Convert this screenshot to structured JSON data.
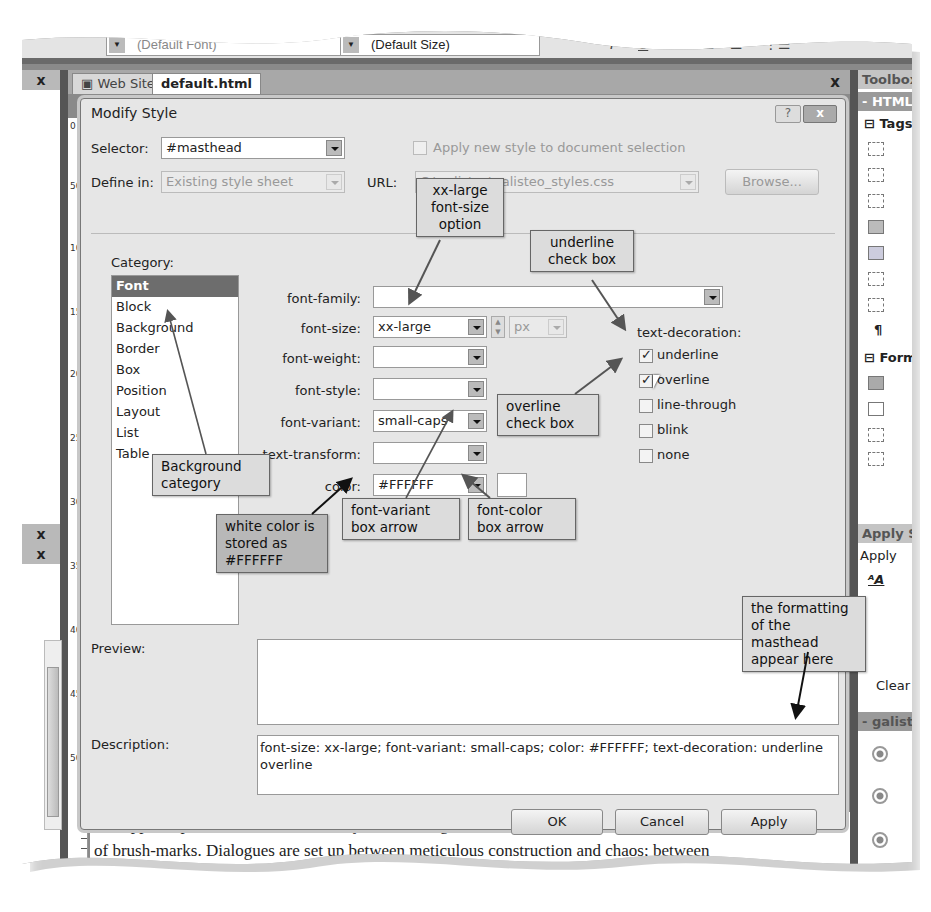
{
  "toolbar": {
    "font_dropdown_value": "(Default Font)",
    "size_dropdown_value": "(Default Size)",
    "buttons": [
      "italic",
      "underline",
      "align-left",
      "align-center",
      "align-right",
      "list"
    ]
  },
  "tabs": [
    {
      "label": "Web Site",
      "active": false
    },
    {
      "label": "default.html",
      "active": true
    }
  ],
  "tab_close": "x",
  "left_panel": {
    "close_labels": [
      "x",
      "x",
      "x"
    ]
  },
  "ruler": {
    "ticks": [
      "0",
      "50",
      "100",
      "150",
      "200",
      "250",
      "300",
      "350",
      "400",
      "450",
      "500"
    ]
  },
  "dialog": {
    "title": "Modify Style",
    "help_button": "?",
    "close_button": "x",
    "selector_label": "Selector:",
    "selector_value": "#masthead",
    "apply_new_style_label": "Apply new style to document selection",
    "apply_new_style_checked": false,
    "define_in_label": "Define in:",
    "define_in_value": "Existing style sheet",
    "url_label": "URL:",
    "url_value": "C:\\galisteo\\galisteo_styles.css",
    "browse_button": "Browse...",
    "category_label": "Category:",
    "categories": [
      "Font",
      "Block",
      "Background",
      "Border",
      "Box",
      "Position",
      "Layout",
      "List",
      "Table"
    ],
    "selected_category": "Font",
    "font_fields": {
      "font_family": {
        "label": "font-family:",
        "value": ""
      },
      "font_size": {
        "label": "font-size:",
        "value": "xx-large",
        "unit": "px"
      },
      "font_weight": {
        "label": "font-weight:",
        "value": ""
      },
      "font_style": {
        "label": "font-style:",
        "value": ""
      },
      "font_variant": {
        "label": "font-variant:",
        "value": "small-caps"
      },
      "text_transform": {
        "label": "text-transform:",
        "value": ""
      },
      "color": {
        "label": "color:",
        "value": "#FFFFFF",
        "swatch": "#FFFFFF"
      }
    },
    "text_decoration": {
      "label": "text-decoration:",
      "options": [
        {
          "label": "underline",
          "checked": true
        },
        {
          "label": "overline",
          "checked": true
        },
        {
          "label": "line-through",
          "checked": false
        },
        {
          "label": "blink",
          "checked": false
        },
        {
          "label": "none",
          "checked": false
        }
      ]
    },
    "preview_label": "Preview:",
    "description_label": "Description:",
    "description_value": "font-size: xx-large; font-variant: small-caps; color: #FFFFFF; text-decoration: underline overline",
    "ok_button": "OK",
    "cancel_button": "Cancel",
    "apply_button": "Apply"
  },
  "right_panel": {
    "toolbox_header": "Toolbox",
    "html_header": "- HTML",
    "tags_group": "Tags",
    "forms_group": "Form",
    "apply_styles_header": "Apply Styles",
    "apply_styles_tab": "Apply",
    "clear_label": "Clear",
    "galisteo_header": "- galisteo"
  },
  "document_text": {
    "line1": "unstoppable proliferations of natural systems through luminous paint and baroque excesses",
    "line2": "of brush-marks. Dialogues are set up between meticulous construction and chaos; between"
  },
  "callouts": {
    "xx_large": "xx-large font-size option",
    "underline": "underline check box",
    "background": "Background category",
    "overline": "overline check box",
    "white_color": "white color is stored as #FFFFFF",
    "font_variant_arrow": "font-variant box arrow",
    "font_color_arrow": "font-color box arrow",
    "formatting": "the formatting of the masthead appear here"
  }
}
